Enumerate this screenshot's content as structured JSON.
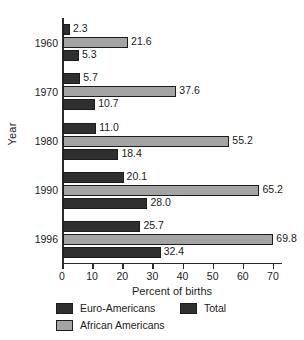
{
  "chart_data": {
    "type": "bar",
    "orientation": "horizontal",
    "title": "",
    "xlabel": "Percent of births",
    "ylabel": "Year",
    "categories": [
      "1960",
      "1970",
      "1980",
      "1990",
      "1996"
    ],
    "series": [
      {
        "name": "Euro-Americans",
        "color": "#2f2f2f",
        "values": [
          2.3,
          5.7,
          11.0,
          20.1,
          25.7
        ]
      },
      {
        "name": "African Americans",
        "color": "#a4a4a4",
        "values": [
          21.6,
          37.6,
          55.2,
          65.2,
          69.8
        ]
      },
      {
        "name": "Total",
        "color": "#2f2f2f",
        "values": [
          5.3,
          10.7,
          18.4,
          28.0,
          32.4
        ]
      }
    ],
    "value_labels": [
      [
        "2.3",
        "21.6",
        "5.3"
      ],
      [
        "5.7",
        "37.6",
        "10.7"
      ],
      [
        "11.0",
        "55.2",
        "18.4"
      ],
      [
        "20.1",
        "65.2",
        "28.0"
      ],
      [
        "25.7",
        "69.8",
        "32.4"
      ]
    ],
    "xlim": [
      0,
      73
    ],
    "xticks": [
      0,
      10,
      20,
      30,
      40,
      50,
      60,
      70
    ],
    "xtick_labels": [
      "0",
      "10",
      "20",
      "30",
      "40",
      "50",
      "60",
      "70"
    ],
    "grid": false,
    "legend_position": "below-axis",
    "legend_order": [
      "Euro-Americans",
      "African Americans",
      "Total"
    ]
  },
  "axes": {
    "y_title": "Year",
    "x_title": "Percent of births"
  },
  "legend": {
    "items": [
      {
        "label": "Euro-Americans",
        "swatch": "dark"
      },
      {
        "label": "African Americans",
        "swatch": "light"
      },
      {
        "label": "Total",
        "swatch": "dark"
      }
    ]
  }
}
